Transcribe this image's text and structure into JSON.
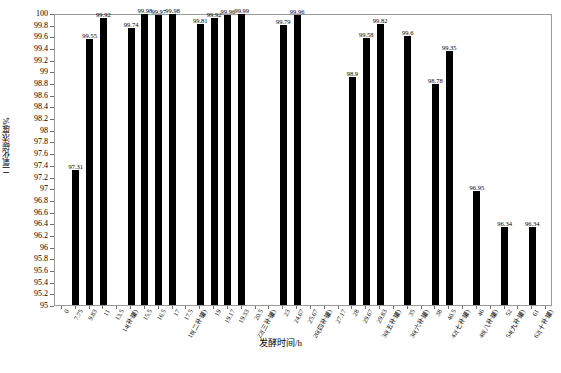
{
  "chart_data": {
    "type": "bar",
    "title": "",
    "xlabel": "发酵时间/h",
    "ylabel": "二氧化碳浓度/%",
    "ylim": [
      95,
      100
    ],
    "ytick_step": 0.2,
    "grid": false,
    "legend": null,
    "bar_color": "#000000",
    "categories": [
      "0",
      "7.75",
      "9.83",
      "11",
      "13.5",
      "14(补罐)",
      "15.5",
      "16.5",
      "17",
      "17.5",
      "18(二补罐)",
      "19",
      "19.17",
      "19.33",
      "20.5",
      "22(三补罐)",
      "23",
      "24.67",
      "25.67",
      "26(四补罐)",
      "27.17",
      "28",
      "29.67",
      "29.83",
      "30(五补罐)",
      "35",
      "36(六补罐)",
      "38",
      "40.5",
      "42(七补罐)",
      "46",
      "48(八补罐)",
      "52",
      "54(九补罐)",
      "61",
      "62(十补罐)"
    ],
    "values": [
      null,
      97.31,
      99.55,
      99.92,
      null,
      99.74,
      99.98,
      99.97,
      99.98,
      null,
      99.81,
      99.92,
      99.96,
      99.99,
      null,
      null,
      99.79,
      99.96,
      null,
      null,
      null,
      98.9,
      99.58,
      99.82,
      null,
      99.6,
      null,
      98.78,
      99.35,
      null,
      96.95,
      null,
      96.34,
      null,
      96.34,
      null
    ],
    "value_labels": [
      "",
      "97.31",
      "99.55",
      "99.92",
      "",
      "99.74",
      "99.98",
      "99.97",
      "99.98",
      "",
      "99.81",
      "99.92",
      "99.96",
      "99.99",
      "",
      "",
      "99.79",
      "99.96",
      "",
      "",
      "",
      "98.9",
      "99.58",
      "99.82",
      "",
      "99.6",
      "",
      "98.78",
      "99.35",
      "",
      "96.95",
      "",
      "96.34",
      "",
      "96.34",
      ""
    ],
    "ytick_labels": [
      "100",
      "99.8",
      "99.6",
      "99.4",
      "99.2",
      "99",
      "98.8",
      "98.6",
      "98.4",
      "98.2",
      "98",
      "97.8",
      "97.6",
      "97.4",
      "97.2",
      "97",
      "96.8",
      "96.6",
      "96.4",
      "96.2",
      "96",
      "95.8",
      "95.6",
      "95.4",
      "95.2",
      "95"
    ],
    "ytick_values": [
      100,
      99.8,
      99.6,
      99.4,
      99.2,
      99,
      98.8,
      98.6,
      98.4,
      98.2,
      98,
      97.8,
      97.6,
      97.4,
      97.2,
      97,
      96.8,
      96.6,
      96.4,
      96.2,
      96,
      95.8,
      95.6,
      95.4,
      95.2,
      95
    ]
  }
}
